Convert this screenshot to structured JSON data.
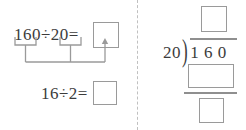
{
  "worksheet": {
    "left_panel": {
      "top_equation": {
        "dividend": "160",
        "operator": "÷",
        "divisor": "20",
        "equals": "=",
        "text": "160÷20=",
        "answer_box_value": ""
      },
      "bottom_equation": {
        "dividend": "16",
        "operator": "÷",
        "divisor": "2",
        "equals": "=",
        "text": "16÷2=",
        "answer_box_value": ""
      },
      "connector": {
        "description": "underbrackets under 160 and 20 joining and an arrow pointing up to the top answer box"
      }
    },
    "right_panel": {
      "long_division": {
        "divisor": "20",
        "bracket": ")",
        "dividend_digits": [
          "1",
          "6",
          "0"
        ],
        "dividend": "1 6 0",
        "quotient_box_value": "",
        "product_box_value": "",
        "remainder_box_value": ""
      }
    },
    "divider": {
      "style": "dashed-vertical"
    },
    "colors": {
      "ink": "#3c3c3c",
      "box_border": "#9a9a9a",
      "rule": "#8f8f8f",
      "divider": "#c0c0c0",
      "background": "#ffffff"
    }
  }
}
